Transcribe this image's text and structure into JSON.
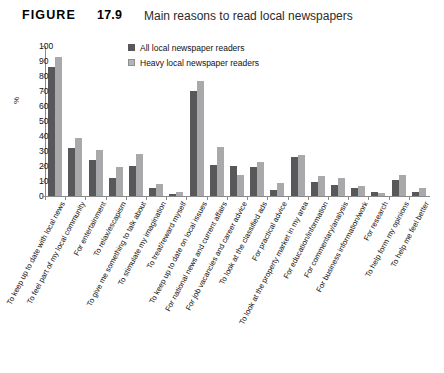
{
  "header": {
    "figure_label": "FIGURE",
    "figure_number": "17.9",
    "title": "Main reasons to read local newspapers"
  },
  "legend": {
    "position": "top-center",
    "entries": [
      {
        "name": "all-local-newspaper-readers",
        "label": "All local newspaper readers",
        "color": "#58585a"
      },
      {
        "name": "heavy-local-newspaper-readers",
        "label": "Heavy local newspaper readers",
        "color": "#b4b4b6"
      }
    ]
  },
  "chart_data": {
    "type": "bar",
    "title": "Main reasons to read local newspapers",
    "xlabel": "",
    "ylabel": "%",
    "ylim": [
      0,
      100
    ],
    "yticks": [
      0,
      10,
      20,
      30,
      40,
      50,
      60,
      70,
      80,
      90,
      100
    ],
    "grid": false,
    "legend_position": "top-center",
    "categories": [
      "To keep up to date with local news",
      "To feel part of my local community",
      "For entertainment",
      "To relax/escapism",
      "To give me something to talk about",
      "To stimulate my imagination",
      "To treat/reward myself",
      "To keep up to date on local issues",
      "For national news and current affairs",
      "For job vacancies and career advice",
      "To look at the classified ads",
      "For practical advice",
      "To look at the property market in my area",
      "For education/information",
      "For commentary/analysis",
      "For business information/work",
      "For research",
      "To help form my opinions",
      "To help me feel better"
    ],
    "series": [
      {
        "name": "All local newspaper readers",
        "color": "#58585a",
        "values": [
          86,
          32,
          24,
          12,
          20,
          5.5,
          1.5,
          70,
          20.5,
          20,
          19.5,
          4,
          26,
          9.5,
          7.5,
          5.5,
          2.5,
          11,
          2.5
        ]
      },
      {
        "name": "Heavy local newspaper readers",
        "color": "#a9a9ab",
        "values": [
          93,
          39,
          31,
          19.5,
          28,
          8,
          3,
          77,
          32.5,
          14,
          22.5,
          9,
          27.5,
          13.5,
          12,
          6.5,
          2,
          14,
          5.5
        ]
      }
    ]
  }
}
